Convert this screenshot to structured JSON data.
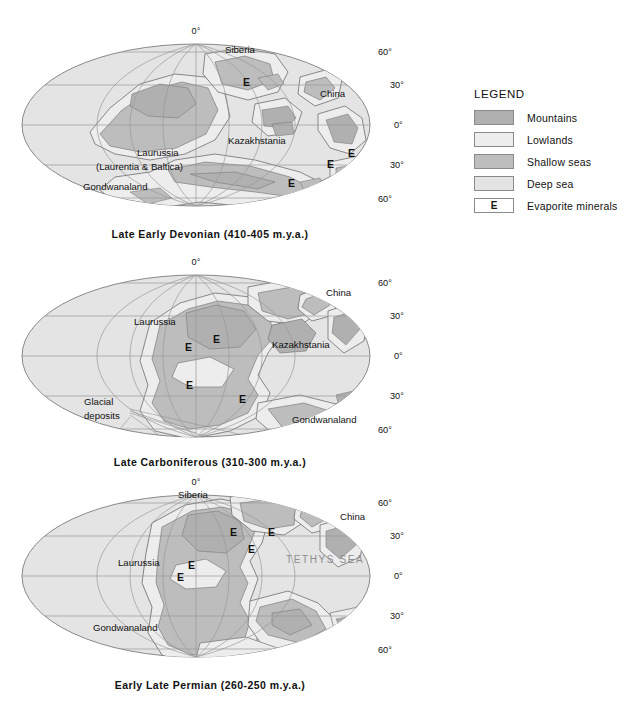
{
  "figure": {
    "type": "paleogeographic-map-series",
    "background": "#ffffff",
    "projection": "Mollweide (oval equal-area)"
  },
  "colors": {
    "deep_sea": "#e4e4e4",
    "shallow_seas": "#bdbdbd",
    "lowlands": "#ededed",
    "mountains": "#b0b0b0",
    "graticule": "#9a9a9a",
    "outline": "#7d7d7d",
    "coast": "#6f6f6f",
    "text": "#111111",
    "sea_label": "#8d8d8d"
  },
  "legend": {
    "title": "LEGEND",
    "items": [
      {
        "label": "Mountains",
        "swatch": "#b0b0b0",
        "symbol": ""
      },
      {
        "label": "Lowlands",
        "swatch": "#ededed",
        "symbol": ""
      },
      {
        "label": "Shallow seas",
        "swatch": "#bdbdbd",
        "symbol": ""
      },
      {
        "label": "Deep sea",
        "swatch": "#e4e4e4",
        "symbol": ""
      },
      {
        "label": "Evaporite minerals",
        "swatch": "#ffffff",
        "symbol": "E"
      }
    ]
  },
  "maps": [
    {
      "id": "map1",
      "caption": "Late Early Devonian (410-405 m.y.a.)",
      "period": "Late Early Devonian",
      "age_range_mya": "410-405",
      "graticule_labels": {
        "top_center": "0°",
        "right": [
          "60°",
          "30°",
          "0°",
          "30°",
          "60°"
        ]
      },
      "continent_labels": [
        {
          "text": "Siberia",
          "x": 225,
          "y": 31
        },
        {
          "text": "China",
          "x": 320,
          "y": 75
        },
        {
          "text": "Kazakhstania",
          "x": 228,
          "y": 122
        },
        {
          "text": "Laurussia",
          "x": 137,
          "y": 134
        },
        {
          "text": "(Laurentia & Baltica)",
          "x": 96,
          "y": 148
        },
        {
          "text": "Gondwanaland",
          "x": 83,
          "y": 168
        }
      ],
      "evaporites": [
        {
          "x": 243,
          "y": 64
        },
        {
          "x": 348,
          "y": 135
        },
        {
          "x": 327,
          "y": 146
        },
        {
          "x": 288,
          "y": 165
        }
      ]
    },
    {
      "id": "map2",
      "caption": "Late Carboniferous (310-300 m.y.a.)",
      "period": "Late Carboniferous",
      "age_range_mya": "310-300",
      "graticule_labels": {
        "top_center": "0°",
        "right": [
          "60°",
          "30°",
          "0°",
          "30°",
          "60°"
        ]
      },
      "continent_labels": [
        {
          "text": "Laurussia",
          "x": 134,
          "y": 72
        },
        {
          "text": "China",
          "x": 326,
          "y": 43
        },
        {
          "text": "Kazakhstania",
          "x": 272,
          "y": 95
        },
        {
          "text": "Gondwanaland",
          "x": 292,
          "y": 170
        },
        {
          "text": "Glacial",
          "x": 84,
          "y": 152
        },
        {
          "text": "deposits",
          "x": 84,
          "y": 166
        }
      ],
      "evaporites": [
        {
          "x": 213,
          "y": 90
        },
        {
          "x": 185,
          "y": 98
        },
        {
          "x": 186,
          "y": 136
        },
        {
          "x": 239,
          "y": 150
        }
      ]
    },
    {
      "id": "map3",
      "caption": "Early Late Permian (260-250 m.y.a.)",
      "period": "Early Late Permian",
      "age_range_mya": "260-250",
      "ocean_label": "TETHYS  SEA",
      "graticule_labels": {
        "top_center": "0°",
        "right": [
          "60°",
          "30°",
          "0°",
          "30°",
          "60°"
        ]
      },
      "continent_labels": [
        {
          "text": "Siberia",
          "x": 178,
          "y": 25
        },
        {
          "text": "China",
          "x": 340,
          "y": 47
        },
        {
          "text": "Laurussia",
          "x": 118,
          "y": 93
        },
        {
          "text": "Gondwanaland",
          "x": 93,
          "y": 158
        }
      ],
      "evaporites": [
        {
          "x": 230,
          "y": 63
        },
        {
          "x": 268,
          "y": 63
        },
        {
          "x": 248,
          "y": 80
        },
        {
          "x": 188,
          "y": 96
        },
        {
          "x": 177,
          "y": 108
        }
      ]
    }
  ]
}
